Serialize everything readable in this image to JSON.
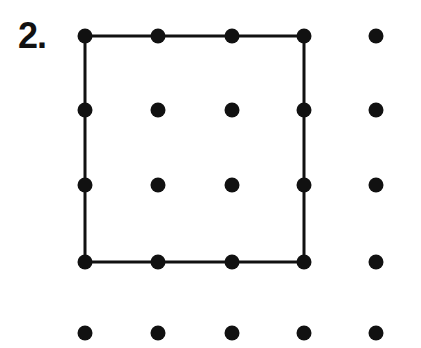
{
  "worksheet": {
    "problem_label": "2.",
    "canvas": {
      "width": 421,
      "height": 348
    },
    "background_color": "#ffffff",
    "ink_color": "#111111"
  },
  "dot_grid": {
    "rows": 5,
    "columns": 5,
    "dot_radius": 7.5,
    "column_x": [
      85,
      158,
      232,
      304,
      376
    ],
    "row_y": [
      36,
      110,
      185,
      262,
      333
    ],
    "dots": [
      {
        "row": 0,
        "col": 0,
        "cx": 85,
        "cy": 36
      },
      {
        "row": 0,
        "col": 1,
        "cx": 158,
        "cy": 36
      },
      {
        "row": 0,
        "col": 2,
        "cx": 232,
        "cy": 36
      },
      {
        "row": 0,
        "col": 3,
        "cx": 304,
        "cy": 36
      },
      {
        "row": 0,
        "col": 4,
        "cx": 376,
        "cy": 36
      },
      {
        "row": 1,
        "col": 0,
        "cx": 85,
        "cy": 110
      },
      {
        "row": 1,
        "col": 1,
        "cx": 158,
        "cy": 110
      },
      {
        "row": 1,
        "col": 2,
        "cx": 232,
        "cy": 110
      },
      {
        "row": 1,
        "col": 3,
        "cx": 304,
        "cy": 110
      },
      {
        "row": 1,
        "col": 4,
        "cx": 376,
        "cy": 110
      },
      {
        "row": 2,
        "col": 0,
        "cx": 85,
        "cy": 185
      },
      {
        "row": 2,
        "col": 1,
        "cx": 158,
        "cy": 185
      },
      {
        "row": 2,
        "col": 2,
        "cx": 232,
        "cy": 185
      },
      {
        "row": 2,
        "col": 3,
        "cx": 304,
        "cy": 185
      },
      {
        "row": 2,
        "col": 4,
        "cx": 376,
        "cy": 185
      },
      {
        "row": 3,
        "col": 0,
        "cx": 85,
        "cy": 262
      },
      {
        "row": 3,
        "col": 1,
        "cx": 158,
        "cy": 262
      },
      {
        "row": 3,
        "col": 2,
        "cx": 232,
        "cy": 262
      },
      {
        "row": 3,
        "col": 3,
        "cx": 304,
        "cy": 262
      },
      {
        "row": 3,
        "col": 4,
        "cx": 376,
        "cy": 262
      },
      {
        "row": 4,
        "col": 0,
        "cx": 85,
        "cy": 333
      },
      {
        "row": 4,
        "col": 1,
        "cx": 158,
        "cy": 333
      },
      {
        "row": 4,
        "col": 2,
        "cx": 232,
        "cy": 333
      },
      {
        "row": 4,
        "col": 3,
        "cx": 304,
        "cy": 333
      },
      {
        "row": 4,
        "col": 4,
        "cx": 376,
        "cy": 333
      }
    ]
  },
  "drawn_shape": {
    "name": "square",
    "stroke_width": 3,
    "vertices": [
      {
        "row": 0,
        "col": 0,
        "x": 85,
        "y": 36
      },
      {
        "row": 0,
        "col": 3,
        "x": 304,
        "y": 36
      },
      {
        "row": 3,
        "col": 3,
        "x": 304,
        "y": 262
      },
      {
        "row": 3,
        "col": 0,
        "x": 85,
        "y": 262
      }
    ],
    "edges": [
      {
        "name": "top-edge",
        "x1": 85,
        "y1": 36,
        "x2": 304,
        "y2": 36
      },
      {
        "name": "right-edge",
        "x1": 304,
        "y1": 36,
        "x2": 304,
        "y2": 262
      },
      {
        "name": "bottom-edge",
        "x1": 304,
        "y1": 262,
        "x2": 85,
        "y2": 262
      },
      {
        "name": "left-edge",
        "x1": 85,
        "y1": 262,
        "x2": 85,
        "y2": 36
      }
    ]
  }
}
